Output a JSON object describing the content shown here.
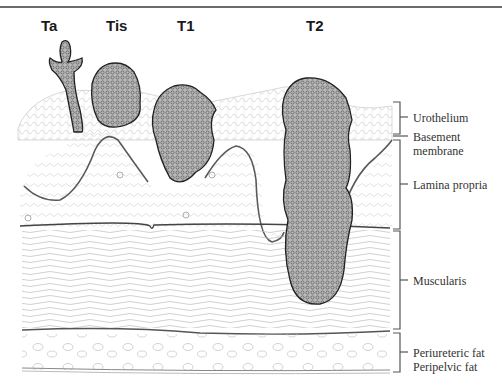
{
  "diagram": {
    "title_stages": [
      {
        "id": "ta",
        "label": "Ta",
        "x": 41,
        "y": 17
      },
      {
        "id": "tis",
        "label": "Tis",
        "x": 106,
        "y": 17
      },
      {
        "id": "t1",
        "label": "T1",
        "x": 177,
        "y": 17
      },
      {
        "id": "t2",
        "label": "T2",
        "x": 306,
        "y": 17
      }
    ],
    "layers": [
      {
        "id": "urothelium",
        "label": "Urothelium"
      },
      {
        "id": "basement-membrane",
        "label": "Basement\nmembrane"
      },
      {
        "id": "lamina-propria",
        "label": "Lamina propria"
      },
      {
        "id": "muscularis",
        "label": "Muscularis"
      },
      {
        "id": "fat",
        "label": "Periureteric fat\nPeripelvic fat"
      }
    ],
    "colors": {
      "line": "#555555",
      "tumor_fill": "#9a9a9a",
      "tumor_edge": "#2a2a2a",
      "tissue": "#bdbdbd"
    }
  }
}
